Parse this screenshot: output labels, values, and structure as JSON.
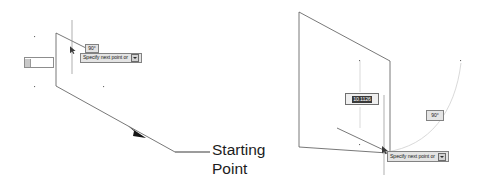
{
  "figure": {
    "background": "#ffffff",
    "line_color": "#555555",
    "accent_color": "#1c1c1c"
  },
  "annotation": {
    "starting_point_label": "Starting\nPoint"
  },
  "left_view": {
    "angle_tooltip": "90°",
    "prompt_tooltip": "Specify next point or",
    "input_field_value": "",
    "caret_icon": "chevron-down-icon",
    "cursor_icon": "crosshair-cursor-icon",
    "arrow_icon": "direction-arrow-icon"
  },
  "right_view": {
    "length_value": "10.1126",
    "angle_tooltip": "90°",
    "prompt_tooltip": "Specify next point or",
    "caret_icon": "chevron-down-icon",
    "cursor_icon": "crosshair-cursor-icon"
  }
}
